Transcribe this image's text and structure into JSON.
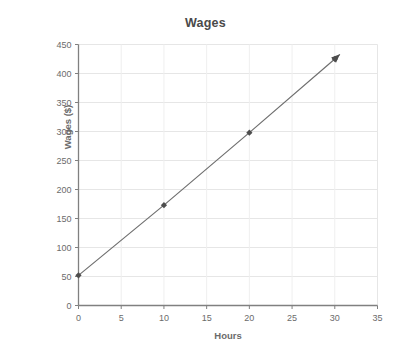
{
  "chart_data": {
    "type": "line",
    "title": "Wages",
    "xlabel": "Hours",
    "ylabel": "Wages ($)",
    "xlim": [
      0,
      35
    ],
    "ylim": [
      0,
      450
    ],
    "xticks": [
      0,
      5,
      10,
      15,
      20,
      25,
      30,
      35
    ],
    "yticks": [
      0,
      50,
      100,
      150,
      200,
      250,
      300,
      350,
      400,
      450
    ],
    "xtick_labels": [
      "0",
      "5",
      "10",
      "15",
      "20",
      "25",
      "30",
      "35"
    ],
    "ytick_labels": [
      "0",
      "50",
      "100",
      "150",
      "200",
      "250",
      "300",
      "350",
      "400",
      "450"
    ],
    "grid": true,
    "grid_axis": "both",
    "legend": false,
    "legend_position": "none",
    "markers": "diamond",
    "line_end_arrow": true,
    "series": [
      {
        "name": "Wages",
        "x": [
          0,
          10,
          20,
          30
        ],
        "values": [
          52,
          173,
          298,
          425
        ],
        "color": "#6b6b6b"
      }
    ],
    "line_extension": {
      "x": 30.6,
      "y": 433
    },
    "colors": {
      "line": "#6f6f6f",
      "marker": "#4d4d4d",
      "axis": "#808080",
      "grid_horizontal": "#e6e6e6",
      "grid_vertical": "#efefef",
      "text": "#6b6b6b",
      "title": "#4a4a4a",
      "background": "#ffffff"
    }
  }
}
